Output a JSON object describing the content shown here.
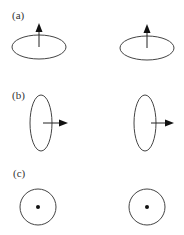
{
  "figure": {
    "panels": [
      {
        "id": "a",
        "label": "(a)",
        "description": "horizontal current loop seen obliquely, moment arrow pointing up",
        "loops": [
          {
            "view": "ellipse-horizontal",
            "moment_direction": "up"
          },
          {
            "view": "ellipse-horizontal",
            "moment_direction": "up"
          }
        ]
      },
      {
        "id": "b",
        "label": "(b)",
        "description": "vertical current loop seen edge-on, moment arrow pointing right",
        "loops": [
          {
            "view": "ellipse-vertical",
            "moment_direction": "right"
          },
          {
            "view": "ellipse-vertical",
            "moment_direction": "right"
          }
        ]
      },
      {
        "id": "c",
        "label": "(c)",
        "description": "loop seen face-on, moment pointing out of page (dot)",
        "loops": [
          {
            "view": "circle",
            "moment_direction": "out-of-page"
          },
          {
            "view": "circle",
            "moment_direction": "out-of-page"
          }
        ]
      }
    ],
    "colors": {
      "stroke": "#444444",
      "arrow": "#111111",
      "background": "#ffffff"
    }
  }
}
